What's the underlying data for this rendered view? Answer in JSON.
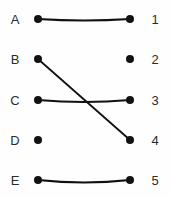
{
  "diagram": {
    "type": "bipartite-graph",
    "title": "",
    "width": 172,
    "height": 197,
    "background_color": "#fefefe",
    "stroke_color": "#111111",
    "label_color": "#2b2b2b",
    "node_radius": 4.0,
    "edge_width": 1.8,
    "left_column": {
      "label_x": 15,
      "dot_x": 38,
      "nodes": [
        {
          "id": "A",
          "label": "A",
          "y": 19
        },
        {
          "id": "B",
          "label": "B",
          "y": 59
        },
        {
          "id": "C",
          "label": "C",
          "y": 100
        },
        {
          "id": "D",
          "label": "D",
          "y": 140
        },
        {
          "id": "E",
          "label": "E",
          "y": 180
        }
      ]
    },
    "right_column": {
      "label_x": 155,
      "dot_x": 130,
      "nodes": [
        {
          "id": "1",
          "label": "1",
          "y": 19
        },
        {
          "id": "2",
          "label": "2",
          "y": 59
        },
        {
          "id": "3",
          "label": "3",
          "y": 100
        },
        {
          "id": "4",
          "label": "4",
          "y": 140
        },
        {
          "id": "5",
          "label": "5",
          "y": 180
        }
      ]
    },
    "edges": [
      {
        "from": "A",
        "to": "1",
        "x1": 38,
        "y1": 19,
        "x2": 130,
        "y2": 19,
        "sag": 1.5
      },
      {
        "from": "B",
        "to": "4",
        "x1": 38,
        "y1": 59,
        "x2": 130,
        "y2": 140,
        "sag": 0
      },
      {
        "from": "C",
        "to": "3",
        "x1": 38,
        "y1": 100,
        "x2": 130,
        "y2": 100,
        "sag": 2.0
      },
      {
        "from": "E",
        "to": "5",
        "x1": 38,
        "y1": 180,
        "x2": 130,
        "y2": 180,
        "sag": 2.5
      }
    ],
    "unmatched_nodes": [
      "D",
      "2"
    ]
  }
}
